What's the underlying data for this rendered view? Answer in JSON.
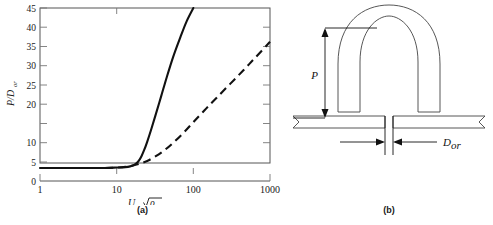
{
  "figure": {
    "panel_a_caption": "(a)",
    "panel_b_caption": "(b)"
  },
  "chart_data": {
    "type": "line",
    "title": "",
    "xlabel": "U_or sqrt(rho_g)",
    "xlabel_main": "U",
    "xlabel_main_sub": "or",
    "xlabel_radicand": "ρ",
    "xlabel_radicand_sub": "g",
    "ylabel": "P/D_or",
    "ylabel_num": "P/D",
    "ylabel_sub": "or",
    "xscale": "log",
    "yscale": "linear",
    "xlim": [
      1,
      1000
    ],
    "ylim": [
      0,
      45
    ],
    "grid": false,
    "legend": "none",
    "xticks": [
      1,
      10,
      100,
      1000
    ],
    "xtick_labels": [
      "1",
      "10",
      "100",
      "1000"
    ],
    "yticks": [
      0,
      5,
      10,
      15,
      20,
      25,
      30,
      35,
      40,
      45
    ],
    "ytick_labels": [
      "0",
      "5",
      "10",
      "",
      "20",
      "25",
      "30",
      "35",
      "40",
      "45"
    ],
    "series": [
      {
        "name": "solid-curve",
        "style": "solid",
        "x": [
          1,
          2,
          4,
          7,
          10,
          13,
          15,
          17,
          19,
          21,
          23,
          25,
          28,
          32,
          38,
          45,
          55,
          68,
          82,
          100
        ],
        "y": [
          3.4,
          3.4,
          3.4,
          3.4,
          3.5,
          3.6,
          3.8,
          4.2,
          5.0,
          6.4,
          8.2,
          10.2,
          13.2,
          17.0,
          22.0,
          27.0,
          32.5,
          37.5,
          41.6,
          45.0
        ]
      },
      {
        "name": "dashed-curve",
        "style": "dashed",
        "x": [
          1,
          2,
          4,
          7,
          10,
          13,
          16,
          20,
          25,
          32,
          42,
          55,
          75,
          100,
          140,
          200,
          300,
          450,
          650,
          1000
        ],
        "y": [
          3.4,
          3.4,
          3.4,
          3.4,
          3.5,
          3.7,
          4.0,
          4.5,
          5.2,
          6.4,
          8.0,
          10.0,
          12.6,
          15.3,
          18.4,
          21.6,
          25.2,
          28.8,
          32.2,
          36.2
        ]
      }
    ]
  },
  "diagram": {
    "name": "orifice-jet-penetration-diagram",
    "labels": {
      "penetration": "P",
      "orifice_diameter_main": "D",
      "orifice_diameter_sub": "or"
    }
  }
}
